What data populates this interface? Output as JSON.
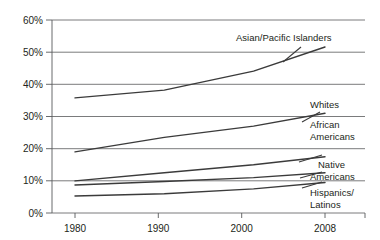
{
  "chart_data": {
    "type": "line",
    "title": "",
    "subtitle": "",
    "xlabel": "",
    "ylabel": "",
    "x": [
      1980,
      1990,
      2000,
      2008
    ],
    "xlim": [
      1976,
      2012
    ],
    "ylim": [
      0,
      60
    ],
    "xtick_labels": [
      "1980",
      "1990",
      "2000",
      "2008"
    ],
    "ytick_labels": [
      "0%",
      "10%",
      "20%",
      "30%",
      "40%",
      "50%",
      "60%"
    ],
    "ytick_values": [
      0,
      10,
      20,
      30,
      40,
      50,
      60
    ],
    "grid": "horizontal",
    "legend_position": "inline-right-labels",
    "line_color": "#3b3b3b",
    "grid_color": "#58595b",
    "series": [
      {
        "name": "Asian/Pacific Islanders",
        "label": "Asian/Pacific Islanders",
        "values": [
          35.8,
          38.2,
          44.1,
          51.6
        ]
      },
      {
        "name": "Whites",
        "label": "Whites",
        "values": [
          19.0,
          23.5,
          27.0,
          31.0
        ]
      },
      {
        "name": "African Americans",
        "label_line1": "African",
        "label_line2": "Americans",
        "values": [
          10.0,
          12.5,
          15.0,
          17.5
        ]
      },
      {
        "name": "Native Americans",
        "label_line1": "Native",
        "label_line2": "Americans",
        "values": [
          8.7,
          9.8,
          11.0,
          12.5
        ]
      },
      {
        "name": "Hispanics/Latinos",
        "label_line1": "Hispanics/",
        "label_line2": "Latinos",
        "values": [
          5.3,
          6.0,
          7.5,
          9.5
        ]
      }
    ]
  }
}
